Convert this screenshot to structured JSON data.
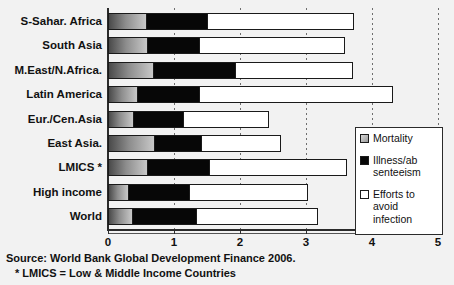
{
  "chart_data": {
    "type": "bar",
    "orientation": "horizontal",
    "stacked": true,
    "title": "",
    "xlabel": "",
    "ylabel": "",
    "xlim": [
      0,
      5
    ],
    "xticks": [
      0,
      1,
      2,
      3,
      4,
      5
    ],
    "xtick_labels": [
      "0",
      "1",
      "2",
      "3",
      "4",
      "5"
    ],
    "grid": true,
    "grid_axis": "x",
    "grid_style": "dashed",
    "legend_position": "right",
    "categories": [
      "S-Sahar. Africa",
      "South Asia",
      "M.East/N.Africa.",
      "Latin America",
      "Eur./Cen.Asia",
      "East Asia.",
      "LMICS *",
      "High income",
      "World"
    ],
    "series": [
      {
        "name": "Mortality",
        "color": "#8d8d8d",
        "values": [
          0.58,
          0.59,
          0.68,
          0.44,
          0.38,
          0.7,
          0.59,
          0.3,
          0.36
        ]
      },
      {
        "name": "Illness/absenteeism",
        "color": "#070707",
        "values": [
          0.94,
          0.8,
          1.26,
          0.95,
          0.77,
          0.73,
          0.95,
          0.94,
          0.98
        ]
      },
      {
        "name": "Efforts to avoid infection",
        "color": "#ffffff",
        "values": [
          2.21,
          2.2,
          1.77,
          2.93,
          1.29,
          1.19,
          2.08,
          1.79,
          1.84
        ]
      }
    ],
    "totals": [
      3.73,
      3.59,
      3.71,
      4.32,
      2.44,
      2.62,
      3.62,
      3.03,
      3.18
    ]
  },
  "legend": {
    "items": [
      {
        "label": "Mortality",
        "swatch": "gradient-gray-square-icon"
      },
      {
        "label": "Illness/ab\nsenteeism",
        "swatch": "black-square-icon"
      },
      {
        "label": "Efforts to\navoid\ninfection",
        "swatch": "white-square-icon"
      }
    ]
  },
  "footnotes": {
    "source": "Source:  World Bank Global Development Finance 2006.",
    "lmics": "* LMICS = Low & Middle Income Countries"
  }
}
